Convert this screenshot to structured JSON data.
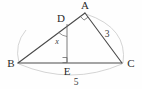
{
  "figure": {
    "type": "geometry-diagram",
    "background_color": "#fefefe",
    "line_color": "#4a4a4a",
    "faint_arc_color": "#cfcfcf",
    "label_color": "#2b2b2b"
  },
  "vertices": {
    "A": {
      "label": "A",
      "x": 85,
      "y": 13,
      "label_x": 85,
      "label_y": 9
    },
    "B": {
      "label": "B",
      "x": 18,
      "y": 63,
      "label_x": 11,
      "label_y": 67
    },
    "C": {
      "label": "C",
      "x": 122,
      "y": 63,
      "label_x": 130,
      "label_y": 67
    },
    "D": {
      "label": "D",
      "x": 67,
      "y": 24,
      "label_x": 61,
      "label_y": 21
    },
    "E": {
      "label": "E",
      "x": 67,
      "y": 63,
      "label_x": 67,
      "label_y": 74
    }
  },
  "segments": [
    {
      "name": "segment-BA",
      "from": "B",
      "to": "A"
    },
    {
      "name": "segment-AC",
      "from": "A",
      "to": "C"
    },
    {
      "name": "segment-BC",
      "from": "B",
      "to": "C"
    },
    {
      "name": "segment-DE",
      "from": "D",
      "to": "E"
    }
  ],
  "measure_labels": {
    "side_ac": "3",
    "side_ac_x": 107,
    "side_ac_y": 36,
    "side_bc": "5",
    "side_bc_x": 74,
    "side_bc_y": 84,
    "angle_d": "x",
    "angle_d_x": 56,
    "angle_d_y": 44
  },
  "angle_marks": [
    {
      "name": "right-angle-at-A",
      "vertex": "A",
      "type": "square"
    },
    {
      "name": "right-angle-at-E",
      "vertex": "E",
      "type": "square"
    },
    {
      "name": "angle-x-at-D",
      "vertex": "D",
      "type": "arc",
      "label": "x"
    }
  ],
  "arcs": [
    {
      "name": "lower-arc-B-to-C",
      "description": "faint arc below BC"
    },
    {
      "name": "right-arc-A-to-C",
      "description": "faint arc right of AC"
    }
  ]
}
